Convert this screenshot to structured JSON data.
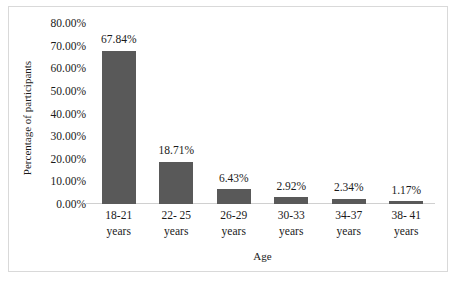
{
  "chart_data": {
    "type": "bar",
    "title": "",
    "xlabel": "Age",
    "ylabel": "Percentage of participants",
    "categories": [
      "18-21 years",
      "22- 25 years",
      "26-29 years",
      "30-33 years",
      "34-37 years",
      "38- 41 years"
    ],
    "category_lines": [
      [
        "18-21",
        "years"
      ],
      [
        "22- 25",
        "years"
      ],
      [
        "26-29",
        "years"
      ],
      [
        "30-33",
        "years"
      ],
      [
        "34-37",
        "years"
      ],
      [
        "38- 41",
        "years"
      ]
    ],
    "values": [
      67.84,
      18.71,
      6.43,
      2.92,
      2.34,
      1.17
    ],
    "value_labels": [
      "67.84%",
      "18.71%",
      "6.43%",
      "2.92%",
      "2.34%",
      "1.17%"
    ],
    "ylim": [
      0,
      80
    ],
    "ytick_values": [
      0,
      10,
      20,
      30,
      40,
      50,
      60,
      70,
      80
    ],
    "ytick_labels": [
      "0.00%",
      "10.00%",
      "20.00%",
      "30.00%",
      "40.00%",
      "50.00%",
      "60.00%",
      "70.00%",
      "80.00%"
    ],
    "grid": false,
    "legend": "none",
    "bar_color": "#595959",
    "axis_color": "#d0d0d0",
    "text_color": "#1a1a1a",
    "background": "#ffffff",
    "border_color": "#d9d9d9"
  }
}
